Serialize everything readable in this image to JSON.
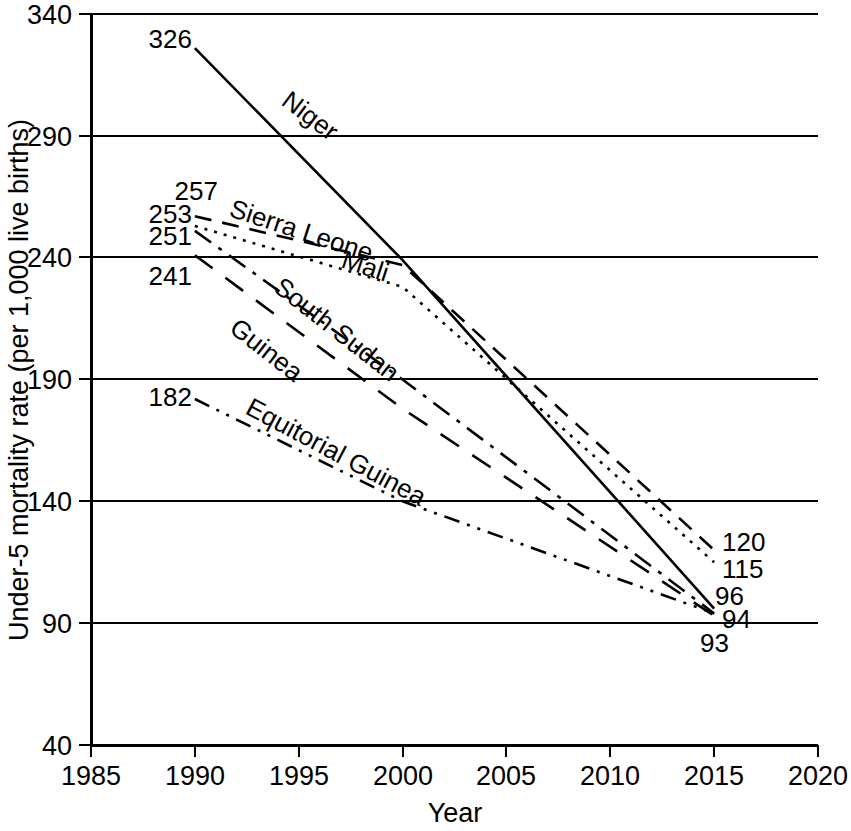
{
  "chart_data": {
    "type": "line",
    "title": "",
    "xlabel": "Year",
    "ylabel": "Under-5 mortality rate (per 1,000 live births)",
    "xlim": [
      1985,
      2020
    ],
    "ylim": [
      40,
      340
    ],
    "xticks": [
      1985,
      1990,
      1995,
      2000,
      2005,
      2010,
      2015,
      2020
    ],
    "yticks": [
      40,
      90,
      140,
      190,
      240,
      290,
      340
    ],
    "grid": "horizontal",
    "legend": "inline-labels",
    "x": [
      1990,
      2000,
      2015
    ],
    "series": [
      {
        "name": "Niger",
        "label": "Niger",
        "linestyle": "solid",
        "values": [
          326,
          239,
          96
        ],
        "start_label": "326",
        "end_label": "96",
        "label_x": 280,
        "label_y": 104,
        "label_rotate": 37
      },
      {
        "name": "Sierra Leone",
        "label": "Sierra Leone",
        "linestyle": "dashed",
        "values": [
          257,
          237,
          120
        ],
        "start_label": "257",
        "end_label": "120",
        "label_x": 228,
        "label_y": 216,
        "label_rotate": 18
      },
      {
        "name": "Mali",
        "label": "Mali",
        "linestyle": "dotted",
        "values": [
          253,
          228,
          115
        ],
        "start_label": "253",
        "end_label": "115",
        "label_x": 340,
        "label_y": 267,
        "label_rotate": 18
      },
      {
        "name": "South Sudan",
        "label": "South Sudan",
        "linestyle": "dashdot",
        "values": [
          251,
          190,
          94
        ],
        "start_label": "251",
        "end_label": "94",
        "label_x": 272,
        "label_y": 290,
        "label_rotate": 38
      },
      {
        "name": "Guinea",
        "label": "Guinea",
        "linestyle": "longdash",
        "values": [
          241,
          178,
          93
        ],
        "start_label": "241",
        "end_label": "93",
        "label_x": 228,
        "label_y": 331,
        "label_rotate": 38
      },
      {
        "name": "Equitorial Guinea",
        "label": "Equitorial Guinea",
        "linestyle": "dashdotdot",
        "values": [
          182,
          140,
          94
        ],
        "start_label": "182",
        "end_label": "",
        "label_x": 244,
        "label_y": 413,
        "label_rotate": 28
      }
    ],
    "start_value_labels": [
      {
        "text": "326",
        "x": 192,
        "y": 48
      },
      {
        "text": "257",
        "x": 218,
        "y": 200
      },
      {
        "text": "253",
        "x": 192,
        "y": 223
      },
      {
        "text": "251",
        "x": 192,
        "y": 245
      },
      {
        "text": "241",
        "x": 192,
        "y": 285
      },
      {
        "text": "182",
        "x": 192,
        "y": 406
      }
    ],
    "end_value_labels": [
      {
        "text": "120",
        "x": 722,
        "y": 551
      },
      {
        "text": "115",
        "x": 722,
        "y": 578
      },
      {
        "text": "96",
        "x": 715,
        "y": 605
      },
      {
        "text": "94",
        "x": 722,
        "y": 628
      },
      {
        "text": "93",
        "x": 700,
        "y": 652
      }
    ]
  }
}
